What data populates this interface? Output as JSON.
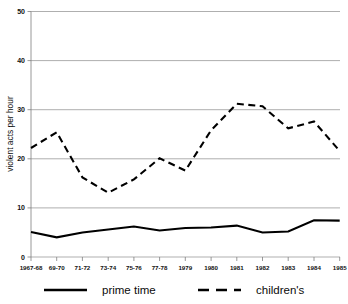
{
  "chart_data": {
    "type": "line",
    "title": "",
    "xlabel": "",
    "ylabel": "violent acts per hour",
    "ylim": [
      0,
      50
    ],
    "yticks": [
      0,
      10,
      20,
      30,
      40,
      50
    ],
    "grid": true,
    "legend_position": "bottom",
    "categories": [
      "1967-68",
      "69-70",
      "71-72",
      "73-74",
      "75-76",
      "77-78",
      "1979",
      "1980",
      "1981",
      "1982",
      "1983",
      "1984",
      "1985"
    ],
    "series": [
      {
        "name": "prime time",
        "style": "solid",
        "color": "#000000",
        "values": [
          5.1,
          4.0,
          5.0,
          5.6,
          6.2,
          5.4,
          5.9,
          6.0,
          6.4,
          5.0,
          5.2,
          7.5,
          7.4
        ]
      },
      {
        "name": "children's",
        "style": "dashed",
        "color": "#000000",
        "values": [
          22.2,
          25.4,
          16.2,
          13.1,
          15.8,
          20.1,
          17.6,
          25.8,
          31.2,
          30.7,
          26.2,
          27.6,
          21.6
        ]
      }
    ]
  },
  "axis": {
    "y_title": "violent acts per hour",
    "y_tick_labels": [
      "0",
      "10",
      "20",
      "30",
      "40",
      "50"
    ],
    "x_tick_labels": [
      "1967-68",
      "69-70",
      "71-72",
      "73-74",
      "75-76",
      "77-78",
      "1979",
      "1980",
      "1981",
      "1982",
      "1983",
      "1984",
      "1985"
    ]
  },
  "legend": {
    "items": [
      {
        "label": "prime time",
        "style": "solid"
      },
      {
        "label": "children's",
        "style": "dashed"
      }
    ]
  },
  "colors": {
    "line": "#000000",
    "grid": "#8d8d8d",
    "axis": "#7f7f7f",
    "background": "#ffffff"
  }
}
